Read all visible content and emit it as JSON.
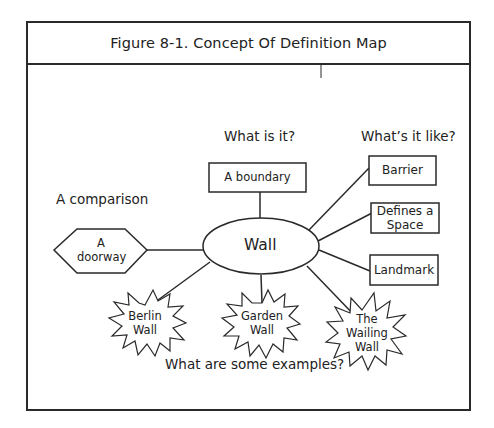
{
  "figure": {
    "title": "Figure 8-1. Concept Of Definition Map"
  },
  "prompts": {
    "what_is_it": "What is it?",
    "whats_it_like": "What’s it like?",
    "comparison": "A comparison",
    "examples": "What are some examples?"
  },
  "center": {
    "label": "Wall"
  },
  "category": {
    "label": "A boundary"
  },
  "properties": [
    {
      "label": "Barrier"
    },
    {
      "label_line1": "Defines a",
      "label_line2": "Space"
    },
    {
      "label": "Landmark"
    }
  ],
  "comparison_node": {
    "label_line1": "A",
    "label_line2": "doorway"
  },
  "examples": [
    {
      "label_line1": "Berlin",
      "label_line2": "Wall"
    },
    {
      "label_line1": "Garden",
      "label_line2": "Wall"
    },
    {
      "label_line1": "The",
      "label_line2": "Wailing",
      "label_line3": "Wall"
    }
  ],
  "colors": {
    "stroke": "#2a2a2a",
    "text": "#222222",
    "background": "#ffffff"
  }
}
